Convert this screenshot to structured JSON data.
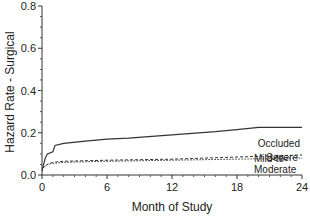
{
  "chart_data": {
    "type": "line",
    "title": "",
    "xlabel": "Month of Study",
    "ylabel": "Hazard Rate - Surgical",
    "xlim": [
      0,
      24
    ],
    "ylim": [
      0,
      0.8
    ],
    "x_ticks": [
      "0",
      "6",
      "12",
      "18",
      "24"
    ],
    "y_ticks": [
      "0.0",
      "0.2",
      "0.4",
      "0.6",
      "0.8"
    ],
    "grid": false,
    "legend": "inline labels at right end of lines",
    "series": [
      {
        "name": "Occluded",
        "style": "solid",
        "x": [
          0,
          0.3,
          0.5,
          1,
          1.2,
          2,
          4,
          6,
          8,
          12,
          16,
          18,
          20,
          24
        ],
        "values": [
          0.02,
          0.08,
          0.1,
          0.11,
          0.14,
          0.15,
          0.16,
          0.17,
          0.175,
          0.19,
          0.205,
          0.215,
          0.225,
          0.225
        ]
      },
      {
        "name": "Severe",
        "style": "dashed",
        "x": [
          0,
          0.5,
          1,
          2,
          6,
          12,
          18,
          24
        ],
        "values": [
          0.03,
          0.05,
          0.06,
          0.065,
          0.07,
          0.075,
          0.085,
          0.095
        ]
      },
      {
        "name": "Mild-to-Moderate",
        "style": "dotted",
        "x": [
          0,
          0.5,
          1,
          2,
          6,
          12,
          18,
          24
        ],
        "values": [
          0.03,
          0.05,
          0.055,
          0.06,
          0.065,
          0.07,
          0.075,
          0.08
        ]
      }
    ]
  },
  "labels": {
    "occluded": "Occluded",
    "severe": "Severe",
    "mild1": "Mild-to-",
    "mild2": "Moderate"
  }
}
